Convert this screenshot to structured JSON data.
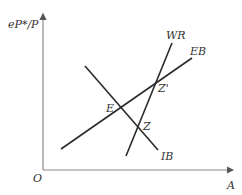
{
  "diagram": {
    "y_axis_label": "eP*/P",
    "x_axis_label": "A",
    "origin_label": "O",
    "curves": [
      {
        "name": "WR",
        "label": "WR"
      },
      {
        "name": "EB",
        "label": "EB"
      },
      {
        "name": "IB",
        "label": "IB"
      }
    ],
    "points": [
      {
        "name": "E",
        "label": "E"
      },
      {
        "name": "Z",
        "label": "Z"
      },
      {
        "name": "Z'",
        "label": "Z'"
      }
    ],
    "colors": {
      "line": "#2a2a2a",
      "axis": "#8a8a8a",
      "text": "#333333"
    }
  }
}
